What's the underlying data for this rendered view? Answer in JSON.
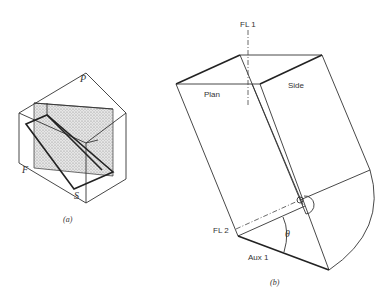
{
  "figure_a": {
    "caption": "(a)",
    "labels": {
      "plane_p": "P",
      "plane_f": "F",
      "plane_s": "S"
    },
    "shading_color": "#bdbdbd"
  },
  "figure_b": {
    "caption": "(b)",
    "labels": {
      "fold_line_1": "FL 1",
      "fold_line_2": "FL 2",
      "plan": "Plan",
      "side": "Side",
      "aux": "Aux 1",
      "angle": "θ"
    }
  }
}
